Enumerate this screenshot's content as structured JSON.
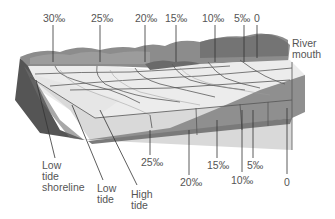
{
  "top_labels": [
    {
      "text": "30‰",
      "x": 43,
      "y": 13
    },
    {
      "text": "25‰",
      "x": 92,
      "y": 13
    },
    {
      "text": "20‰",
      "x": 135,
      "y": 13
    },
    {
      "text": "15‰",
      "x": 165,
      "y": 13
    },
    {
      "text": "10‰",
      "x": 202,
      "y": 13
    },
    {
      "text": "5‰",
      "x": 234,
      "y": 13
    },
    {
      "text": "0",
      "x": 258,
      "y": 13
    }
  ],
  "river_mouth": {
    "line1": "River",
    "line2": "mouth"
  },
  "bottom_labels": [
    {
      "text": "25‰",
      "x": 141,
      "y": 157
    },
    {
      "text": "15‰",
      "x": 207,
      "y": 160
    },
    {
      "text": "5‰",
      "x": 247,
      "y": 160
    },
    {
      "text": "20‰",
      "x": 180,
      "y": 177
    },
    {
      "text": "10‰",
      "x": 231,
      "y": 175
    },
    {
      "text": "0",
      "x": 284,
      "y": 177
    }
  ],
  "zone_labels": {
    "low_tide_shoreline": [
      "Low",
      "tide",
      "shoreline"
    ],
    "low_tide": [
      "Low",
      "tide"
    ],
    "high_tide": [
      "High",
      "tide"
    ]
  },
  "colors": {
    "water_surface": "#e6e6e6",
    "water_side": "#d4d4d4",
    "bottom": "#8a8a8a",
    "shore_dark": "#555555",
    "vegetation": "#7a7a7a",
    "lines": "#555555"
  }
}
